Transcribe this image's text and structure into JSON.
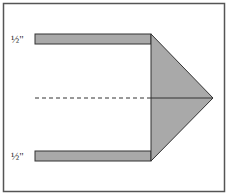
{
  "diagram": {
    "title": "",
    "labels": {
      "top_strip": "½\"",
      "bottom_strip": "½\""
    },
    "colors": {
      "fill": "#a9a9a9",
      "stroke": "#333333",
      "frame": "#555555"
    },
    "shapes": [
      {
        "name": "top-strip",
        "type": "rect"
      },
      {
        "name": "bottom-strip",
        "type": "rect"
      },
      {
        "name": "triangle-point",
        "type": "triangle"
      },
      {
        "name": "center-fold-line",
        "type": "dashed-line"
      }
    ]
  }
}
